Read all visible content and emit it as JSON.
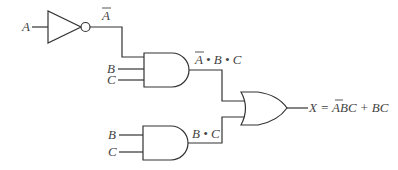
{
  "diagram": {
    "type": "logic-circuit",
    "inputs": {
      "a": "A",
      "b_upper": "B",
      "c_upper": "C",
      "b_lower": "B",
      "c_lower": "C"
    },
    "labels": {
      "not_output": "A",
      "and1_output": "A • B • C",
      "and1_output_a": "A",
      "and1_output_rest": " • B • C",
      "and2_output": "B • C",
      "output_prefix": "X = ",
      "output_abar": "A",
      "output_rest": "BC + BC"
    },
    "gates": [
      {
        "id": "not1",
        "type": "NOT",
        "inputs": [
          "A"
        ],
        "output": "A̅"
      },
      {
        "id": "and1",
        "type": "AND",
        "inputs": [
          "A̅",
          "B",
          "C"
        ],
        "output": "A̅·B·C"
      },
      {
        "id": "and2",
        "type": "AND",
        "inputs": [
          "B",
          "C"
        ],
        "output": "B·C"
      },
      {
        "id": "or1",
        "type": "OR",
        "inputs": [
          "A̅·B·C",
          "B·C"
        ],
        "output": "X"
      }
    ],
    "colors": {
      "line": "#333333",
      "text": "#444444",
      "background": "#ffffff"
    }
  }
}
